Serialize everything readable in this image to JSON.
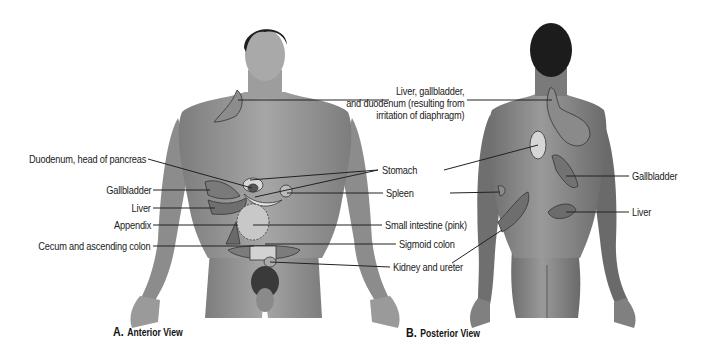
{
  "figure": {
    "colors": {
      "skin_front": "#9a9a9a",
      "skin_back": "#8a8a8a",
      "hair": "#1e1e1e",
      "region": "#7e7e7e",
      "region_light": "#d8d8d8",
      "region_outline": "#333333",
      "leader": "#222222"
    },
    "panels": [
      {
        "id": "A",
        "letter": "A.",
        "caption": "Anterior View",
        "labels_left": [
          {
            "text": "Duodenum, head of pancreas"
          },
          {
            "text": "Gallbladder"
          },
          {
            "text": "Liver"
          },
          {
            "text": "Appendix"
          },
          {
            "text": "Cecum and ascending colon"
          }
        ],
        "labels_right": [
          {
            "text": "Stomach"
          },
          {
            "text": "Spleen"
          },
          {
            "text": "Small intestine (pink)"
          },
          {
            "text": "Sigmoid colon"
          },
          {
            "text": "Kidney and ureter"
          }
        ]
      },
      {
        "id": "B",
        "letter": "B.",
        "caption": "Posterior View",
        "labels_right": [
          {
            "text": "Gallbladder"
          },
          {
            "text": "Liver"
          }
        ]
      }
    ],
    "shared_label": {
      "lines": [
        "Liver, gallbladder,",
        "and duodenum (resulting from",
        "irritation of diaphragm)"
      ]
    }
  }
}
